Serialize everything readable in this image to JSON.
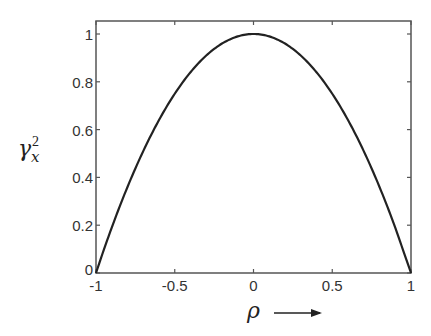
{
  "chart_data": {
    "type": "line",
    "title": "",
    "xlabel": "ρ →",
    "ylabel": "γ_x^2",
    "ylabel_parts": {
      "base": "γ",
      "sup": "2",
      "sub": "x"
    },
    "xlabel_parts": {
      "symbol": "ρ",
      "arrow": "→"
    },
    "xlim": [
      -1,
      1
    ],
    "ylim": [
      0,
      1.05
    ],
    "xticks": [
      -1,
      -0.5,
      0,
      0.5,
      1
    ],
    "xtick_labels": [
      "-1",
      "-0.5",
      "0",
      "0.5",
      "1"
    ],
    "yticks": [
      0,
      0.2,
      0.4,
      0.6,
      0.8,
      1
    ],
    "ytick_labels": [
      "0",
      "0.2",
      "0.4",
      "0.6",
      "0.8",
      "1"
    ],
    "grid": false,
    "legend": null,
    "series": [
      {
        "name": "gamma_x^2 = 1 - rho^2",
        "x": [
          -1,
          -0.9,
          -0.8,
          -0.7,
          -0.6,
          -0.5,
          -0.4,
          -0.3,
          -0.2,
          -0.1,
          0,
          0.1,
          0.2,
          0.3,
          0.4,
          0.5,
          0.6,
          0.7,
          0.8,
          0.9,
          1
        ],
        "values": [
          0,
          0.19,
          0.36,
          0.51,
          0.64,
          0.75,
          0.84,
          0.91,
          0.96,
          0.99,
          1,
          0.99,
          0.96,
          0.91,
          0.84,
          0.75,
          0.64,
          0.51,
          0.36,
          0.19,
          0
        ],
        "color": "#222222"
      }
    ]
  },
  "colors": {
    "axis": "#555555",
    "curve": "#222222",
    "text": "#333333"
  }
}
